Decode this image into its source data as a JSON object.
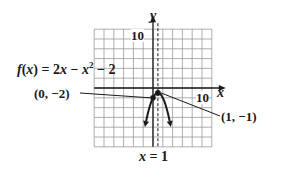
{
  "chart_data": {
    "type": "line",
    "title": "",
    "function_label": "f(x) = 2x − x² − 2",
    "function": {
      "a": -1,
      "b": 2,
      "c": -2
    },
    "xlabel": "x",
    "ylabel": "y",
    "x_tick_label": "10",
    "y_tick_label": "10",
    "xlim": [
      -12,
      12
    ],
    "ylim": [
      -12,
      12
    ],
    "grid": true,
    "grid_step": 2,
    "asymptote_label": "x = 1",
    "axis_of_symmetry": 1,
    "points": [
      {
        "label": "(0, −2)",
        "x": 0,
        "y": -2
      },
      {
        "label": "(1, −1)",
        "x": 1,
        "y": -1
      }
    ],
    "series": [
      {
        "name": "f(x) = 2x − x² − 2",
        "x": [
          -2.3,
          -1.5,
          -1,
          -0.5,
          0,
          0.5,
          1,
          1.5,
          2,
          2.5,
          3,
          4.3
        ],
        "y": [
          -12.9,
          -7.25,
          -5,
          -3.25,
          -2,
          -1.25,
          -1,
          -1.25,
          -2,
          -3.25,
          -5,
          -12.9
        ]
      }
    ]
  },
  "labels": {
    "function": "f(x) = 2x − x² − 2",
    "point_vertex": "(1, −1)",
    "point_intercept": "(0, −2)",
    "axis_symmetry": "x = 1",
    "x_axis": "x",
    "y_axis": "y",
    "x_tick": "10",
    "y_tick": "10"
  },
  "colors": {
    "curve": "#1a1a1a",
    "grid": "#9a9a9a",
    "axis": "#1a1a1a"
  }
}
